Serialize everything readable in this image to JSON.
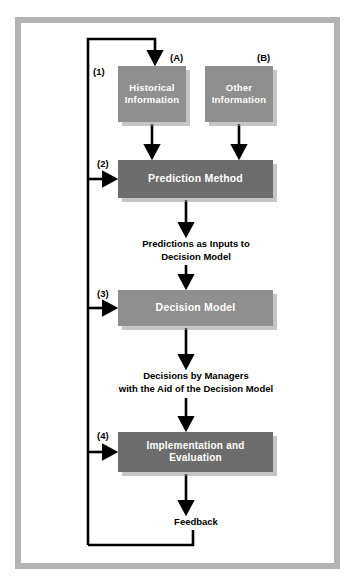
{
  "diagram": {
    "colors": {
      "frame_border": "#b3b3b3",
      "background": "#ffffff",
      "box_medium": "#8f8f8f",
      "box_dark": "#6d6d6d",
      "box_text": "#ffffff",
      "label_text": "#000000",
      "arrow": "#000000",
      "shadow": "#969696"
    },
    "boxes": [
      {
        "id": "historical",
        "tag": "(1)",
        "letter": "(A)",
        "line1": "Historical",
        "line2": "Information",
        "shade": "medium"
      },
      {
        "id": "other",
        "tag": "",
        "letter": "(B)",
        "line1": "Other",
        "line2": "Information",
        "shade": "medium"
      },
      {
        "id": "prediction",
        "tag": "(2)",
        "letter": "",
        "line1": "Prediction Method",
        "line2": "",
        "shade": "dark"
      },
      {
        "id": "decision",
        "tag": "(3)",
        "letter": "",
        "line1": "Decision Model",
        "line2": "",
        "shade": "medium"
      },
      {
        "id": "implementation",
        "tag": "(4)",
        "letter": "",
        "line1": "Implementation and",
        "line2": "Evaluation",
        "shade": "dark"
      }
    ],
    "labels": {
      "predictions_line1": "Predictions as Inputs to",
      "predictions_line2": "Decision Model",
      "decisions_line1": "Decisions by Managers",
      "decisions_line2": "with the Aid of the Decision Model",
      "feedback": "Feedback"
    },
    "tags": {
      "a": "(A)",
      "b": "(B)",
      "one": "(1)",
      "two": "(2)",
      "three": "(3)",
      "four": "(4)"
    },
    "box_text": {
      "historical_line1": "Historical",
      "historical_line2": "Information",
      "other_line1": "Other",
      "other_line2": "Information",
      "prediction": "Prediction Method",
      "decision": "Decision Model",
      "implementation_line1": "Implementation and",
      "implementation_line2": "Evaluation"
    }
  }
}
